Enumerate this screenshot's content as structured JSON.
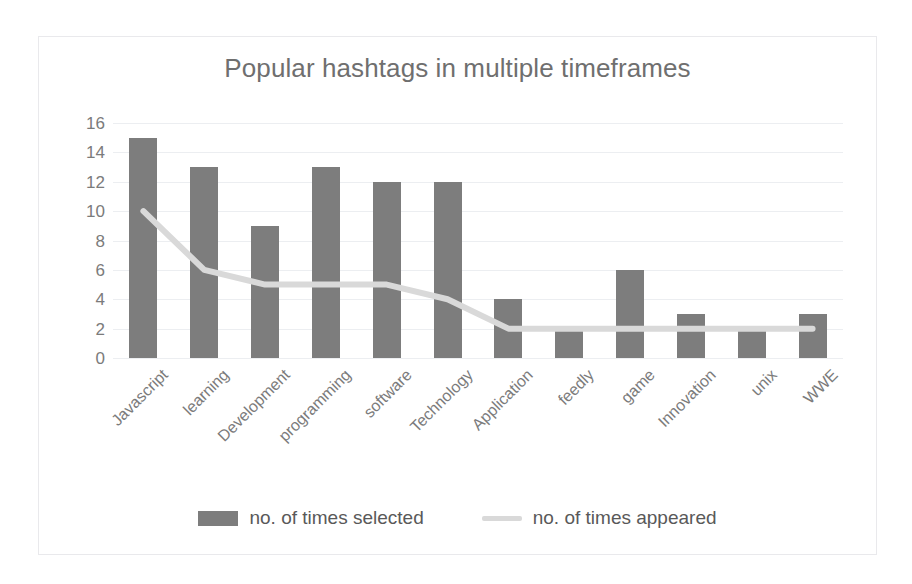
{
  "chart_data": {
    "type": "bar",
    "title": "Popular hashtags in multiple timeframes",
    "xlabel": "",
    "ylabel": "",
    "ylim": [
      0,
      16
    ],
    "ytick_step": 2,
    "yticks": [
      16,
      14,
      12,
      10,
      8,
      6,
      4,
      2,
      0
    ],
    "grid": true,
    "legend_position": "bottom",
    "categories": [
      "Javascript",
      "learning",
      "Development",
      "programming",
      "software",
      "Technology",
      "Application",
      "feedly",
      "game",
      "Innovation",
      "unix",
      "WWE"
    ],
    "series": [
      {
        "name": "no. of times selected",
        "type": "bar",
        "color": "#7d7d7d",
        "values": [
          15,
          13,
          9,
          13,
          12,
          12,
          4,
          2,
          6,
          3,
          2,
          3
        ]
      },
      {
        "name": "no. of times appeared",
        "type": "line",
        "color": "#d9d9d9",
        "values": [
          10,
          6,
          5,
          5,
          5,
          4,
          2,
          2,
          2,
          2,
          2,
          2
        ]
      }
    ]
  },
  "legend": {
    "entries": [
      {
        "label": "no. of times selected",
        "marker": "bar-swatch",
        "color": "#7d7d7d"
      },
      {
        "label": "no. of times appeared",
        "marker": "line-swatch",
        "color": "#d9d9d9"
      }
    ]
  },
  "colors": {
    "bar": "#7d7d7d",
    "line": "#d9d9d9",
    "grid": "#eceef1",
    "title_text": "#6f6f6f",
    "axis_text": "#7b7b7b",
    "legend_text": "#595959",
    "frame_border": "#e9e9ec",
    "background": "#ffffff"
  }
}
